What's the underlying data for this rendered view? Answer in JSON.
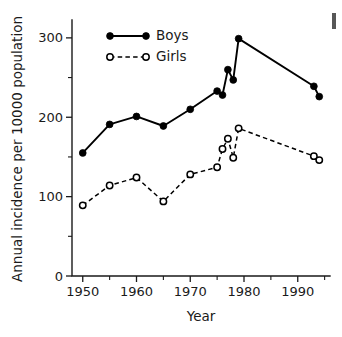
{
  "chart_data": {
    "type": "line",
    "title": "",
    "xlabel": "Year",
    "ylabel": "Annual incidence per 10000 population",
    "xlim": [
      1948,
      1996
    ],
    "ylim": [
      0,
      320
    ],
    "grid": false,
    "legend_position": "top-left-inside",
    "x_ticks_major": [
      1950,
      1960,
      1970,
      1980,
      1990
    ],
    "x_tick_labels": [
      "1950",
      "1960",
      "1970",
      "1980",
      "1990"
    ],
    "x_ticks_minor": [
      1955,
      1965,
      1975,
      1985,
      1995
    ],
    "y_ticks_major": [
      0,
      100,
      200,
      300
    ],
    "y_tick_labels": [
      "0",
      "100",
      "200",
      "300"
    ],
    "y_ticks_minor": [
      50,
      150,
      250
    ],
    "series": [
      {
        "name": "Boys",
        "marker": "filled-circle",
        "linestyle": "solid",
        "color": "#000000",
        "points": [
          {
            "x": 1950,
            "y": 155
          },
          {
            "x": 1955,
            "y": 191
          },
          {
            "x": 1960,
            "y": 201
          },
          {
            "x": 1965,
            "y": 189
          },
          {
            "x": 1970,
            "y": 210
          },
          {
            "x": 1975,
            "y": 233
          },
          {
            "x": 1976,
            "y": 228
          },
          {
            "x": 1977,
            "y": 260
          },
          {
            "x": 1978,
            "y": 247
          },
          {
            "x": 1979,
            "y": 299
          },
          {
            "x": 1993,
            "y": 239
          },
          {
            "x": 1994,
            "y": 226
          }
        ]
      },
      {
        "name": "Girls",
        "marker": "open-circle",
        "linestyle": "dashed",
        "color": "#000000",
        "points": [
          {
            "x": 1950,
            "y": 89
          },
          {
            "x": 1955,
            "y": 114
          },
          {
            "x": 1960,
            "y": 124
          },
          {
            "x": 1965,
            "y": 94
          },
          {
            "x": 1970,
            "y": 128
          },
          {
            "x": 1975,
            "y": 137
          },
          {
            "x": 1976,
            "y": 160
          },
          {
            "x": 1977,
            "y": 173
          },
          {
            "x": 1978,
            "y": 149
          },
          {
            "x": 1979,
            "y": 186
          },
          {
            "x": 1993,
            "y": 151
          },
          {
            "x": 1994,
            "y": 146
          }
        ]
      }
    ]
  },
  "legend": {
    "entries": [
      {
        "label": "Boys",
        "marker": "filled-circle",
        "linestyle": "solid"
      },
      {
        "label": "Girls",
        "marker": "open-circle",
        "linestyle": "dashed"
      }
    ]
  }
}
